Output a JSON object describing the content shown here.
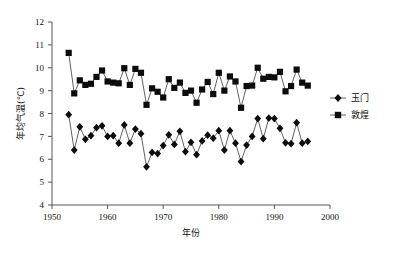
{
  "chart_data": {
    "type": "line",
    "title": "",
    "xlabel": "年份",
    "ylabel": "年均气温(℃)",
    "xlim": [
      1950,
      2000
    ],
    "ylim": [
      4,
      12
    ],
    "xticks": [
      1950,
      1960,
      1970,
      1980,
      1990,
      2000
    ],
    "xtick_labels": [
      "1950",
      "1960",
      "1970",
      "1980",
      "1990",
      "2000"
    ],
    "yticks": [
      4,
      5,
      6,
      7,
      8,
      9,
      10,
      11,
      12
    ],
    "ytick_labels": [
      "4",
      "5",
      "6",
      "7",
      "8",
      "9",
      "10",
      "11",
      "12"
    ],
    "grid": false,
    "legend_position": "right",
    "x": [
      1953,
      1954,
      1955,
      1956,
      1957,
      1958,
      1959,
      1960,
      1961,
      1962,
      1963,
      1964,
      1965,
      1966,
      1967,
      1968,
      1969,
      1970,
      1971,
      1972,
      1973,
      1974,
      1975,
      1976,
      1977,
      1978,
      1979,
      1980,
      1981,
      1982,
      1983,
      1984,
      1985,
      1986,
      1987,
      1988,
      1989,
      1990,
      1991,
      1992,
      1993,
      1994,
      1995,
      1996
    ],
    "series": [
      {
        "name": "玉门",
        "marker": "diamond",
        "values": [
          7.95,
          6.4,
          7.42,
          6.87,
          7.03,
          7.38,
          7.46,
          7.0,
          7.03,
          6.7,
          7.5,
          6.7,
          7.32,
          7.12,
          5.67,
          6.3,
          6.25,
          6.6,
          7.07,
          6.65,
          7.22,
          6.33,
          6.74,
          6.2,
          6.8,
          7.05,
          6.92,
          7.25,
          6.4,
          7.25,
          6.7,
          5.9,
          6.62,
          7.0,
          7.78,
          6.9,
          7.8,
          7.78,
          7.35,
          6.72,
          6.68,
          7.6,
          6.7,
          6.78
        ]
      },
      {
        "name": "敦煌",
        "marker": "square",
        "values": [
          10.65,
          8.88,
          9.45,
          9.25,
          9.3,
          9.6,
          9.88,
          9.4,
          9.35,
          9.32,
          9.98,
          9.25,
          9.95,
          9.78,
          8.38,
          9.1,
          8.95,
          8.7,
          9.5,
          9.12,
          9.35,
          8.9,
          9.0,
          8.47,
          9.05,
          9.38,
          8.85,
          9.78,
          9.0,
          9.62,
          9.4,
          8.25,
          9.2,
          9.22,
          10.0,
          9.52,
          9.6,
          9.58,
          9.82,
          8.97,
          9.2,
          9.92,
          9.35,
          9.22
        ]
      }
    ]
  },
  "legend": {
    "entries": [
      {
        "label": "玉门",
        "marker": "diamond"
      },
      {
        "label": "敦煌",
        "marker": "square"
      }
    ]
  }
}
